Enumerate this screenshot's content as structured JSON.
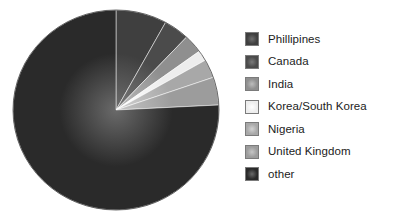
{
  "chart_data": {
    "type": "pie",
    "title": "",
    "subtitle": "",
    "xlabel": "",
    "ylabel": "",
    "grid": false,
    "legend_position": "right",
    "categories": [
      "Phillipines",
      "Canada",
      "India",
      "Korea/South Korea",
      "Nigeria",
      "United Kingdom",
      "other"
    ],
    "values": [
      8.0,
      4.0,
      3.0,
      1.7,
      3.0,
      4.5,
      75.8
    ],
    "colors": [
      "#3f3f3f",
      "#4b4b4b",
      "#8f8f8f",
      "#ededed",
      "#a8a8a8",
      "#9c9c9c",
      "#2a2a2a"
    ],
    "start_angle_deg": 0,
    "direction": "clockwise",
    "slices": [
      {
        "label": "Phillipines",
        "value": 8.0,
        "color": "#3f3f3f",
        "highlight": "#6e6e6e"
      },
      {
        "label": "Canada",
        "value": 4.0,
        "color": "#4b4b4b",
        "highlight": "#7a7a7a"
      },
      {
        "label": "India",
        "value": 3.0,
        "color": "#8f8f8f",
        "highlight": "#bdbdbd"
      },
      {
        "label": "Korea/South Korea",
        "value": 1.7,
        "color": "#ededed",
        "highlight": "#ffffff"
      },
      {
        "label": "Nigeria",
        "value": 3.0,
        "color": "#a8a8a8",
        "highlight": "#d2d2d2"
      },
      {
        "label": "United Kingdom",
        "value": 4.5,
        "color": "#9c9c9c",
        "highlight": "#c6c6c6"
      },
      {
        "label": "other",
        "value": 75.8,
        "color": "#2a2a2a",
        "highlight": "#6a6a6a"
      }
    ]
  },
  "pie": {
    "center_x": 116,
    "center_y": 110,
    "radius_x": 103,
    "radius_y": 100
  },
  "legend": {
    "items": [
      {
        "label": "Phillipines",
        "swatch_name": "legend-swatch-phillipines"
      },
      {
        "label": "Canada",
        "swatch_name": "legend-swatch-canada"
      },
      {
        "label": "India",
        "swatch_name": "legend-swatch-india"
      },
      {
        "label": "Korea/South Korea",
        "swatch_name": "legend-swatch-korea-south-korea"
      },
      {
        "label": "Nigeria",
        "swatch_name": "legend-swatch-nigeria"
      },
      {
        "label": "United Kingdom",
        "swatch_name": "legend-swatch-united-kingdom"
      },
      {
        "label": "other",
        "swatch_name": "legend-swatch-other"
      }
    ]
  }
}
